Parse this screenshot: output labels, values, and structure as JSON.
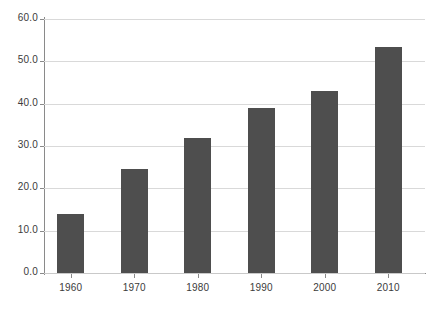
{
  "chart_data": {
    "type": "bar",
    "title": "",
    "subtitle": "",
    "xlabel": "",
    "ylabel": "",
    "categories": [
      "1960",
      "1970",
      "1980",
      "1990",
      "2000",
      "2010"
    ],
    "values": [
      14.0,
      24.5,
      32.0,
      39.0,
      43.0,
      53.5
    ],
    "series": [
      {
        "name": "",
        "values": [
          14.0,
          24.5,
          32.0,
          39.0,
          43.0,
          53.5
        ]
      }
    ],
    "ylim": [
      0.0,
      60.0
    ],
    "yticks": [
      0.0,
      10.0,
      20.0,
      30.0,
      40.0,
      50.0,
      60.0
    ],
    "ytick_labels": [
      "0.0",
      "10.0",
      "20.0",
      "30.0",
      "40.0",
      "50.0",
      "60.0"
    ],
    "xtick_labels": [
      "1960",
      "1970",
      "1980",
      "1990",
      "2000",
      "2010"
    ],
    "grid": "horizontal",
    "legend": "none",
    "bar_color": "#4e4e4e",
    "gridline_color": "#d9d9d9",
    "axis_color": "#8a8a8a",
    "background_color": "#ffffff",
    "text_color": "#3b3b3b"
  }
}
